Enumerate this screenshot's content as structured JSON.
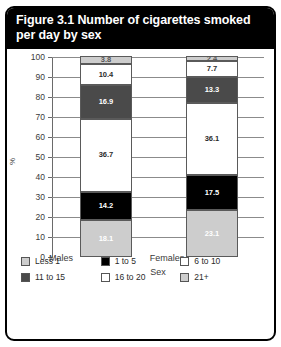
{
  "figure": {
    "title": "Figure 3.1 Number of cigarettes smoked per day by sex"
  },
  "chart_data": {
    "type": "bar",
    "stacked": true,
    "title": "Figure 3.1 Number of cigarettes smoked per day by sex",
    "xlabel": "Sex",
    "ylabel": "%",
    "categories": [
      "Males",
      "Females"
    ],
    "ylim": [
      0,
      100
    ],
    "yticks": [
      0,
      10,
      20,
      30,
      40,
      50,
      60,
      70,
      80,
      90,
      100
    ],
    "grid": true,
    "legend_position": "bottom",
    "series": [
      {
        "name": "Less 1",
        "color": "#cdcdcd",
        "text_color": "#ffffff",
        "values": [
          18.1,
          23.1
        ]
      },
      {
        "name": "1 to 5",
        "color": "#000000",
        "text_color": "#ffffff",
        "values": [
          14.2,
          17.5
        ]
      },
      {
        "name": "6 to 10",
        "color": "#ffffff",
        "text_color": "#2b2b2b",
        "values": [
          36.7,
          36.1
        ]
      },
      {
        "name": "11 to 15",
        "color": "#4a4a4a",
        "text_color": "#ffffff",
        "values": [
          16.9,
          13.3
        ]
      },
      {
        "name": "16 to 20",
        "color": "#ffffff",
        "text_color": "#2b2b2b",
        "values": [
          10.4,
          7.7
        ]
      },
      {
        "name": "21+",
        "color": "#cdcdcd",
        "text_color": "#555555",
        "values": [
          3.8,
          2.4
        ]
      }
    ]
  }
}
